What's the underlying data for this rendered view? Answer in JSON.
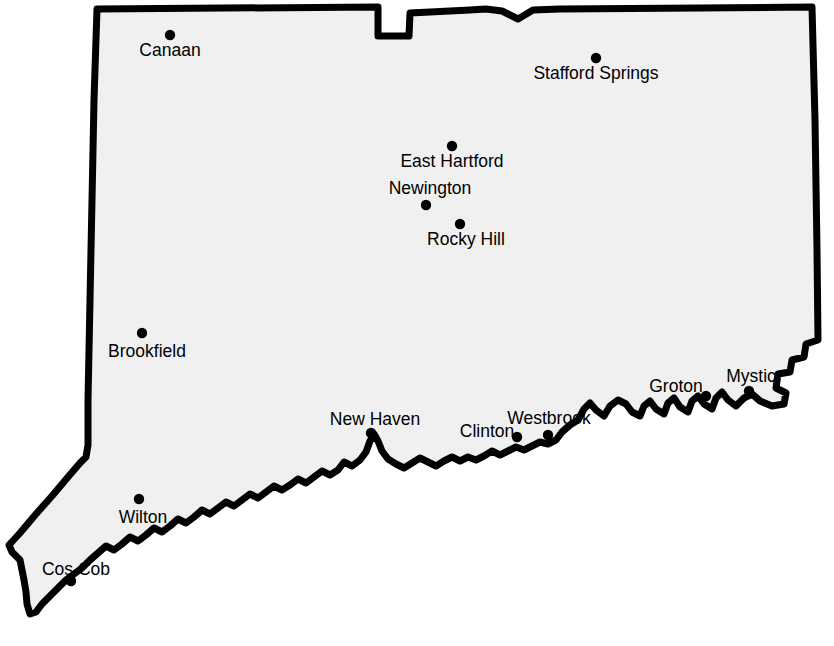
{
  "map": {
    "title": "Connecticut",
    "region_name": "Connecticut",
    "background_color": "#ffffff",
    "land_fill_color": "#f0f0f0",
    "border_color": "#000000",
    "marker_color": "#000000",
    "label_color": "#000000",
    "border_width_px": 7,
    "marker_radius_px": 5.2,
    "label_font_size_px": 17.5,
    "width_px": 834,
    "height_px": 646
  },
  "cities": [
    {
      "name": "Canaan",
      "dot_x": 170,
      "dot_y": 35,
      "label_x": 170,
      "label_y": 56,
      "label_anchor": "middle"
    },
    {
      "name": "Stafford Springs",
      "dot_x": 596,
      "dot_y": 58,
      "label_x": 596,
      "label_y": 79,
      "label_anchor": "middle"
    },
    {
      "name": "East Hartford",
      "dot_x": 452,
      "dot_y": 146,
      "label_x": 452,
      "label_y": 167,
      "label_anchor": "middle"
    },
    {
      "name": "Newington",
      "dot_x": 426,
      "dot_y": 205,
      "label_x": 430,
      "label_y": 194,
      "label_anchor": "middle"
    },
    {
      "name": "Rocky Hill",
      "dot_x": 460,
      "dot_y": 224,
      "label_x": 466,
      "label_y": 245,
      "label_anchor": "middle"
    },
    {
      "name": "Brookfield",
      "dot_x": 142,
      "dot_y": 333,
      "label_x": 147,
      "label_y": 357,
      "label_anchor": "middle"
    },
    {
      "name": "New Haven",
      "dot_x": 371,
      "dot_y": 433,
      "label_x": 375,
      "label_y": 425,
      "label_anchor": "middle"
    },
    {
      "name": "Clinton",
      "dot_x": 517,
      "dot_y": 437,
      "label_x": 487,
      "label_y": 437,
      "label_anchor": "middle"
    },
    {
      "name": "Westbrook",
      "dot_x": 548,
      "dot_y": 435,
      "label_x": 549,
      "label_y": 424,
      "label_anchor": "middle"
    },
    {
      "name": "Groton",
      "dot_x": 706,
      "dot_y": 396,
      "label_x": 676,
      "label_y": 392,
      "label_anchor": "middle"
    },
    {
      "name": "Mystic",
      "dot_x": 749,
      "dot_y": 391,
      "label_x": 751,
      "label_y": 382,
      "label_anchor": "middle"
    },
    {
      "name": "Wilton",
      "dot_x": 139,
      "dot_y": 499,
      "label_x": 143,
      "label_y": 523,
      "label_anchor": "middle"
    },
    {
      "name": "Cos Cob",
      "dot_x": 71,
      "dot_y": 581,
      "label_x": 76,
      "label_y": 575,
      "label_anchor": "middle"
    }
  ],
  "boundary": {
    "description": "Connecticut state outline: straight north border with Southwick Jog notch, straight east border with Rhode Island, straight west border with New York including the southwest panhandle, and the irregular Long Island Sound coastline on the south.",
    "path": "M 97 9 L 378 7 L 378 36 L 409 36 L 410 13 L 470 10 L 486 9 L 502 11 L 518 19 L 533 10 L 560 9 L 700 8 L 812 7 L 815 120 L 817 250 L 818 340 L 806 344 L 804 357 L 792 360 L 790 372 L 778 374 L 776 388 L 786 393 L 784 404 L 772 406 L 760 401 L 752 394 L 744 398 L 736 406 L 728 400 L 722 392 L 716 398 L 712 409 L 704 404 L 698 396 L 692 401 L 688 412 L 680 407 L 674 398 L 668 403 L 664 414 L 656 409 L 650 401 L 644 406 L 640 416 L 632 412 L 626 404 L 618 400 L 610 406 L 604 416 L 596 410 L 590 403 L 584 409 L 578 420 L 570 425 L 562 432 L 556 440 L 548 444 L 540 442 L 532 446 L 524 450 L 516 447 L 508 451 L 500 455 L 492 451 L 484 456 L 476 460 L 468 457 L 460 461 L 452 457 L 444 461 L 436 466 L 428 462 L 420 458 L 412 463 L 404 468 L 396 464 L 388 459 L 382 451 L 378 441 L 374 434 L 370 441 L 366 452 L 360 460 L 352 466 L 344 462 L 338 470 L 330 475 L 322 471 L 314 477 L 306 483 L 298 479 L 290 485 L 282 490 L 274 486 L 266 492 L 258 498 L 250 494 L 242 500 L 234 506 L 226 502 L 218 508 L 210 514 L 202 510 L 194 517 L 186 523 L 178 519 L 170 526 L 162 532 L 154 528 L 146 535 L 138 541 L 130 537 L 122 544 L 114 550 L 106 546 L 98 553 L 90 560 L 82 568 L 74 574 L 66 580 L 58 588 L 50 596 L 42 604 L 36 612 L 30 614 L 27 604 L 26 592 L 24 580 L 22 570 L 20 560 L 12 552 L 9 545 L 20 533 L 36 514 L 52 496 L 68 477 L 80 463 L 86 457 L 88 445 L 88 400 L 90 300 L 92 200 L 94 100 Z",
    "coast_detail_path": "M 818 340 L 806 344 L 804 357 L 792 360 L 790 372 L 778 374 L 776 388 L 786 393 L 784 404 L 772 406 L 760 401 L 752 394 L 744 398 L 736 406 L 728 400 L 722 392 L 716 398 L 712 409 L 704 404 L 698 396 L 692 401 L 688 412 L 680 407 L 674 398 L 668 403 L 664 414 L 656 409 L 650 401 L 644 406 L 640 416 L 632 412 L 626 404 L 618 400 L 610 406 L 604 416 L 596 410 L 590 403 L 584 409 L 578 420 L 570 425 L 562 432 L 556 440 L 548 444 L 540 442 L 532 446 L 524 450 L 516 447 L 508 451 L 500 455 L 492 451 L 484 456 L 476 460 L 468 457 L 460 461 L 452 457 L 444 461 L 436 466 L 428 462 L 420 458 L 412 463 L 404 468 L 396 464 L 388 459 L 382 451 L 378 441 L 374 434 L 370 441 L 366 452 L 360 460 L 352 466 L 344 462 L 338 470 L 330 475 L 322 471 L 314 477 L 306 483 L 298 479 L 290 485 L 282 490 L 274 486 L 266 492 L 258 498 L 250 494 L 242 500 L 234 506 L 226 502 L 218 508 L 210 514 L 202 510 L 194 517 L 186 523 L 178 519 L 170 526 L 162 532 L 154 528 L 146 535 L 138 541 L 130 537 L 122 544 L 114 550 L 106 546 L 98 553 L 90 560 L 82 568 L 74 574 L 66 580 L 58 588 L 50 596 L 42 604 L 36 612 L 30 614"
  }
}
